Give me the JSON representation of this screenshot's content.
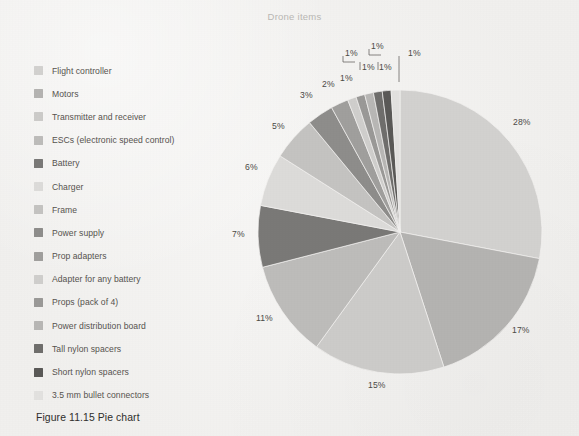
{
  "figure": {
    "caption": "Figure 11.15 Pie chart"
  },
  "chart_data": {
    "type": "pie",
    "title": "Drone items",
    "xlabel": "",
    "ylabel": "",
    "legend_position": "left",
    "grid": false,
    "value_unit": "percent",
    "start_angle_deg": 0,
    "direction": "clockwise",
    "categories": [
      "Flight controller",
      "Motors",
      "Transmitter and receiver",
      "ESCs (electronic speed control)",
      "Battery",
      "Charger",
      "Frame",
      "Power supply",
      "Prop adapters",
      "Adapter for any battery",
      "Props (pack of 4)",
      "Power distribution board",
      "Tall nylon spacers",
      "Short nylon spacers",
      "3.5 mm bullet connectors"
    ],
    "values": [
      28,
      17,
      15,
      11,
      7,
      6,
      5,
      3,
      2,
      1,
      1,
      1,
      1,
      1,
      1
    ],
    "labels": [
      "28%",
      "17%",
      "15%",
      "11%",
      "7%",
      "6%",
      "5%",
      "3%",
      "2%",
      "1%",
      "1%",
      "1%",
      "1%",
      "1%",
      "1%"
    ],
    "colors": [
      "#d2d1cf",
      "#b4b3b1",
      "#cccbc9",
      "#bdbcba",
      "#7a7977",
      "#dcdbd9",
      "#c4c3c1",
      "#8e8d8b",
      "#a09f9d",
      "#cfcecc",
      "#9a9997",
      "#b8b7b5",
      "#6f6e6c",
      "#5a5957",
      "#e2e1df"
    ],
    "total": 100
  },
  "slice_labels": [
    {
      "text": "28%",
      "x": 513,
      "y": 117
    },
    {
      "text": "17%",
      "x": 512,
      "y": 325
    },
    {
      "text": "15%",
      "x": 368,
      "y": 380
    },
    {
      "text": "11%",
      "x": 256,
      "y": 313
    },
    {
      "text": "7%",
      "x": 232,
      "y": 229
    },
    {
      "text": "6%",
      "x": 245,
      "y": 162
    },
    {
      "text": "5%",
      "x": 272,
      "y": 121
    },
    {
      "text": "3%",
      "x": 300,
      "y": 90
    },
    {
      "text": "2%",
      "x": 322,
      "y": 79
    },
    {
      "text": "1%",
      "x": 340,
      "y": 73
    },
    {
      "text": "1%",
      "x": 345,
      "y": 48
    },
    {
      "text": "1%",
      "x": 362,
      "y": 62
    },
    {
      "text": "1%",
      "x": 379,
      "y": 62
    },
    {
      "text": "1%",
      "x": 371,
      "y": 41
    },
    {
      "text": "1%",
      "x": 408,
      "y": 48
    }
  ]
}
